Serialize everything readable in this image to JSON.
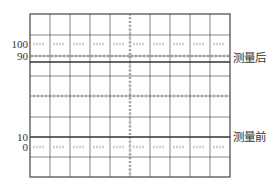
{
  "figure": {
    "type": "oscilloscope-graticule",
    "grid": {
      "left": 30,
      "right": 230,
      "top": 14,
      "bottom": 177,
      "columns": 10,
      "column_width": 20,
      "row_lines_y": [
        14,
        35,
        76,
        117,
        157,
        177
      ],
      "center_vertical_x": 130,
      "center_horizontal_y": 96,
      "line_color": "#555555",
      "frame_color": "#444444"
    },
    "levels": [
      {
        "label": "100",
        "y": 44,
        "style": "dotted-ticks"
      },
      {
        "label": "90",
        "y": 56,
        "style": "ticked-line"
      },
      {
        "label": "10",
        "y": 137,
        "style": "solid-line"
      },
      {
        "label": "0",
        "y": 147,
        "style": "dotted-ticks"
      }
    ],
    "traces": [
      {
        "name": "after",
        "label": "测量后",
        "y": 62,
        "label_y": 58
      },
      {
        "name": "before",
        "label": "测量前",
        "y": 137,
        "label_y": 137
      }
    ]
  }
}
